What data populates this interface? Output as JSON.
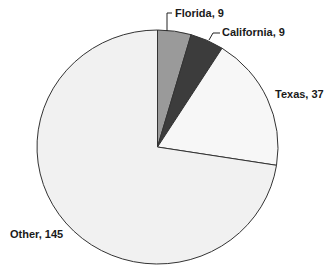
{
  "chart_data": {
    "type": "pie",
    "title": "",
    "categories": [
      "Florida",
      "California",
      "Texas",
      "Other"
    ],
    "values": [
      9,
      9,
      37,
      145
    ],
    "total": 200,
    "start_angle_deg": 0,
    "direction": "clockwise",
    "colors": [
      "#9a9a9a",
      "#3c3c3c",
      "#f7f7f7",
      "#f1f1f1"
    ],
    "edge_color": "#333333",
    "labels": [
      "Florida, 9",
      "California, 9",
      "Texas, 37",
      "Other, 145"
    ],
    "legend": "none",
    "data_labels": true
  },
  "geometry": {
    "cx": 157.5,
    "cy": 147,
    "rx": 120.5,
    "ry": 117
  },
  "label_positions": [
    {
      "x": 175,
      "y": 17,
      "anchor": "start",
      "leader": [
        [
          172,
          13
        ],
        [
          167,
          13
        ],
        [
          167,
          31
        ]
      ]
    },
    {
      "x": 222,
      "y": 36,
      "anchor": "start",
      "leader": [
        [
          220,
          33
        ],
        [
          213,
          33
        ],
        [
          209,
          40
        ]
      ]
    },
    {
      "x": 275,
      "y": 98,
      "anchor": "start",
      "leader": null
    },
    {
      "x": 10,
      "y": 238,
      "anchor": "start",
      "leader": null
    }
  ]
}
